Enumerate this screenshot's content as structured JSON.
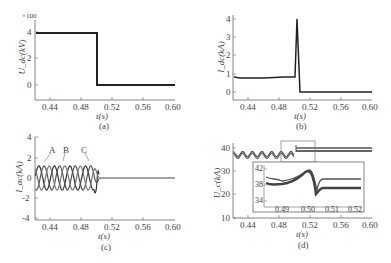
{
  "chart_data": [
    {
      "id": "a",
      "type": "line",
      "caption": "(a)",
      "xlabel": "t(s)",
      "ylabel": "U_dc(kV)",
      "y_multiplier": "×100",
      "xlim": [
        0.42,
        0.6
      ],
      "ylim": [
        -0.6,
        4.5
      ],
      "xticks": [
        "0.44",
        "0.48",
        "0.52",
        "0.56",
        "0.60"
      ],
      "yticks": [
        "0",
        "2",
        "4"
      ],
      "series": [
        {
          "name": "Udc",
          "x": [
            0.42,
            0.5,
            0.5,
            0.6
          ],
          "y": [
            3.95,
            3.95,
            0,
            0
          ]
        }
      ]
    },
    {
      "id": "b",
      "type": "line",
      "caption": "(b)",
      "xlabel": "t(s)",
      "ylabel": "I_dc(kA)",
      "xlim": [
        0.42,
        0.6
      ],
      "ylim": [
        -0.3,
        4.1
      ],
      "xticks": [
        "0.44",
        "0.48",
        "0.52",
        "0.56",
        "0.60"
      ],
      "yticks": [
        "0",
        "1",
        "2",
        "3",
        "4"
      ],
      "series": [
        {
          "name": "Idc",
          "x": [
            0.42,
            0.43,
            0.47,
            0.497,
            0.501,
            0.504,
            0.6
          ],
          "y": [
            0.8,
            0.75,
            0.78,
            0.8,
            4.0,
            0.05,
            0.05
          ]
        }
      ]
    },
    {
      "id": "c",
      "type": "line",
      "caption": "(c)",
      "xlabel": "t(s)",
      "ylabel": "I_ac(kA)",
      "xlim": [
        0.42,
        0.6
      ],
      "ylim": [
        -4,
        4
      ],
      "xticks": [
        "0.44",
        "0.48",
        "0.52",
        "0.56",
        "0.60"
      ],
      "yticks": [
        "-4",
        "-2",
        "0",
        "2",
        "4"
      ],
      "annotations": [
        "A",
        "B",
        "C"
      ],
      "series": [
        {
          "name": "A",
          "description": "sinusoid amplitude ~1.2 kA, 50 Hz, phase 0°, transient spike ~3 kA near 0.50 s, then ~0"
        },
        {
          "name": "B",
          "description": "sinusoid amplitude ~1.2 kA, 50 Hz, phase -120°"
        },
        {
          "name": "C",
          "description": "sinusoid amplitude ~1.2 kA, 50 Hz, phase +120°"
        }
      ]
    },
    {
      "id": "d",
      "type": "line",
      "caption": "(d)",
      "xlabel": "t(s)",
      "ylabel": "U_c(kA)",
      "xlim": [
        0.42,
        0.6
      ],
      "ylim": [
        10,
        45
      ],
      "xticks": [
        "0.44",
        "0.48",
        "0.52",
        "0.56",
        "0.60"
      ],
      "yticks": [
        "10",
        "20",
        "30",
        "40"
      ],
      "series": [
        {
          "name": "Uc upper",
          "description": "ripple ~38.5-41 around 39.5 until 0.50 s, then constant ~40"
        },
        {
          "name": "Uc lower band",
          "description": "ripple until 0.50 s, then thick band ~37.5-38.5"
        }
      ],
      "inset": {
        "xlim": [
          0.484,
          0.52
        ],
        "ylim": [
          34,
          42
        ],
        "xticks": [
          "0.49",
          "0.50",
          "0.51",
          "0.52"
        ],
        "yticks": [
          "34",
          "38",
          "42"
        ],
        "description": "zoom of 0.485-0.505 s region: rises to ~41.8 at 0.50, dips to ~35.8 at 0.503, settles upper 40.3, lower band 37.6-38.6"
      }
    }
  ],
  "labels": {
    "a": {
      "mult": "×100",
      "y": [
        "4",
        "2",
        "0"
      ],
      "x": [
        "0.44",
        "0.48",
        "0.52",
        "0.56",
        "0.60"
      ],
      "xlabel": "t(s)",
      "ylabel": "U_dc(kV)",
      "caption": "(a)"
    },
    "b": {
      "y": [
        "4",
        "3",
        "2",
        "1",
        "0"
      ],
      "x": [
        "0.44",
        "0.48",
        "0.52",
        "0.56",
        "0.60"
      ],
      "xlabel": "t(s)",
      "ylabel": "I_dc(kA)",
      "caption": "(b)"
    },
    "c": {
      "y": [
        "4",
        "2",
        "0",
        "-2",
        "-4"
      ],
      "x": [
        "0.44",
        "0.48",
        "0.52",
        "0.56",
        "0.60"
      ],
      "xlabel": "t(s)",
      "ylabel": "I_ac(kA)",
      "caption": "(c)",
      "phases": [
        "A",
        "B",
        "C"
      ]
    },
    "d": {
      "y": [
        "40",
        "30",
        "20",
        "10"
      ],
      "x": [
        "0.44",
        "0.48",
        "0.52",
        "0.56",
        "0.60"
      ],
      "xlabel": "t(s)",
      "ylabel": "U_c(kA)",
      "caption": "(d)",
      "inset_y": [
        "42",
        "38",
        "34"
      ],
      "inset_x": [
        "0.49",
        "0.50",
        "0.51",
        "0.52"
      ]
    }
  }
}
